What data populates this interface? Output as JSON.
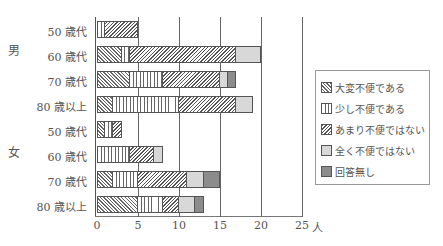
{
  "chart_data": {
    "type": "bar",
    "orientation": "horizontal",
    "stacked": true,
    "title": "",
    "xlabel": "人",
    "ylabel": "",
    "xlim": [
      0,
      25
    ],
    "x_ticks": [
      "0",
      "5",
      "10",
      "15",
      "20",
      "25"
    ],
    "grid": true,
    "legend_position": "right",
    "groups": [
      {
        "label": "男",
        "categories": [
          "50 歳代",
          "60 歳代",
          "70 歳代",
          "80 歳以上"
        ]
      },
      {
        "label": "女",
        "categories": [
          "50 歳代",
          "60 歳代",
          "70 歳代",
          "80 歳以上"
        ]
      }
    ],
    "categories": [
      "男 50 歳代",
      "男 60 歳代",
      "男 70 歳代",
      "男 80 歳以上",
      "女 50 歳代",
      "女 60 歳代",
      "女 70 歳代",
      "女 80 歳以上"
    ],
    "series": [
      {
        "name": "大変不便である",
        "values": [
          0,
          3,
          4,
          2,
          1,
          0,
          2,
          5
        ]
      },
      {
        "name": "少し不便である",
        "values": [
          1,
          1,
          4,
          8,
          1,
          4,
          3,
          3
        ]
      },
      {
        "name": "あまり不便ではない",
        "values": [
          4,
          13,
          7,
          7,
          1,
          3,
          6,
          2
        ]
      },
      {
        "name": "全く不便ではない",
        "values": [
          0,
          3,
          1,
          2,
          0,
          1,
          2,
          2
        ]
      },
      {
        "name": "回答無し",
        "values": [
          0,
          0,
          1,
          0,
          0,
          0,
          2,
          1
        ]
      }
    ]
  },
  "labels": {
    "group_male": "男",
    "group_female": "女",
    "rows": [
      "50 歳代",
      "60 歳代",
      "70 歳代",
      "80 歳以上",
      "50 歳代",
      "60 歳代",
      "70 歳代",
      "80 歳以上"
    ],
    "ticks": [
      "0",
      "5",
      "10",
      "15",
      "20",
      "25"
    ],
    "unit": "人"
  },
  "legend": [
    "大変不便である",
    "少し不便である",
    "あまり不便ではない",
    "全く不便ではない",
    "回答無し"
  ]
}
